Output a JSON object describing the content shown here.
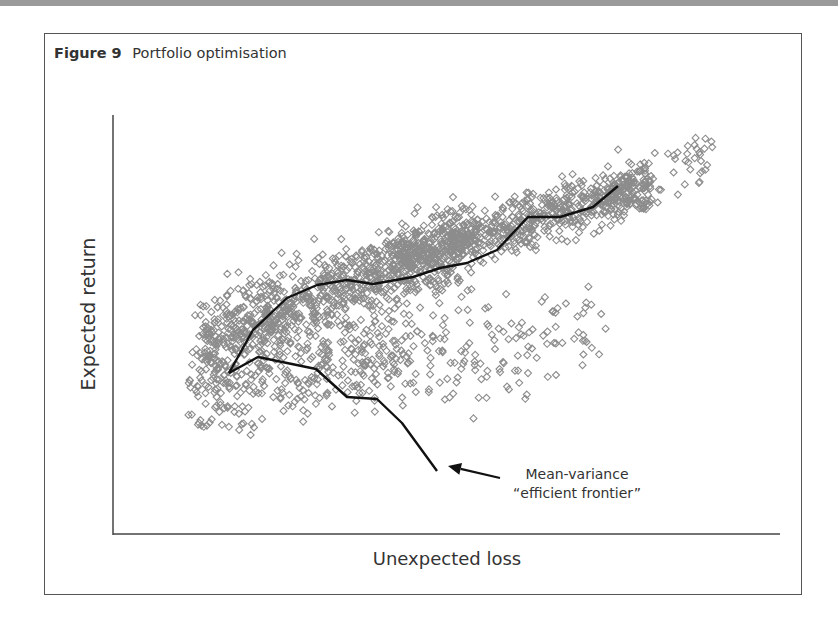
{
  "figure": {
    "number_label": "Figure 9",
    "title": "Portfolio optimisation"
  },
  "chart_data": {
    "type": "scatter",
    "title": "Portfolio optimisation",
    "xlabel": "Unexpected loss",
    "ylabel": "Expected return",
    "ticks": "none",
    "grid": false,
    "legend": "none",
    "annotation": {
      "line1": "Mean-variance",
      "line2": "“efficient frontier”",
      "arrow_from": [
        500,
        478
      ],
      "arrow_to": [
        448,
        466
      ]
    },
    "marker": {
      "shape": "diamond",
      "size": 7,
      "color": "#8c8c8c"
    },
    "line_color": "#111111",
    "scatter_clusters": [
      {
        "count": 900,
        "x_from": 200,
        "x_to": 470,
        "y_from": 340,
        "y_to": 240,
        "spread": 34
      },
      {
        "count": 700,
        "x_from": 400,
        "x_to": 650,
        "y_from": 260,
        "y_to": 185,
        "spread": 22
      },
      {
        "count": 380,
        "x_from": 190,
        "x_to": 420,
        "y_from": 390,
        "y_to": 350,
        "spread": 38
      },
      {
        "count": 120,
        "x_from": 420,
        "x_to": 600,
        "y_from": 360,
        "y_to": 330,
        "spread": 45
      },
      {
        "count": 70,
        "x_from": 600,
        "x_to": 710,
        "y_from": 190,
        "y_to": 165,
        "spread": 25
      }
    ],
    "frontier_upper": [
      [
        229,
        373
      ],
      [
        253,
        330
      ],
      [
        287,
        298
      ],
      [
        317,
        285
      ],
      [
        347,
        280
      ],
      [
        373,
        284
      ],
      [
        413,
        277
      ],
      [
        440,
        268
      ],
      [
        467,
        263
      ],
      [
        497,
        250
      ],
      [
        528,
        217
      ],
      [
        560,
        217
      ],
      [
        593,
        207
      ],
      [
        618,
        186
      ]
    ],
    "frontier_lower": [
      [
        229,
        373
      ],
      [
        258,
        357
      ],
      [
        316,
        369
      ],
      [
        347,
        397
      ],
      [
        377,
        399
      ],
      [
        402,
        423
      ],
      [
        437,
        471
      ]
    ]
  }
}
